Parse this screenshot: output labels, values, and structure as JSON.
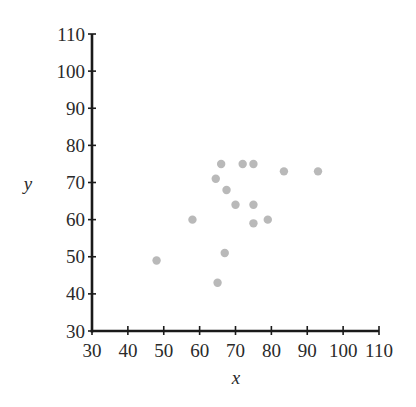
{
  "chart_data": {
    "type": "scatter",
    "title": "",
    "xlabel": "x",
    "ylabel": "y",
    "xlim": [
      30,
      110
    ],
    "ylim": [
      30,
      110
    ],
    "xticks": [
      30,
      40,
      50,
      60,
      70,
      80,
      90,
      100,
      110
    ],
    "yticks": [
      30,
      40,
      50,
      60,
      70,
      80,
      90,
      100,
      110
    ],
    "grid": false,
    "legend": null,
    "point_color": "#b9b9b9",
    "axis_color": "#1a1a1a",
    "points": [
      {
        "x": 48,
        "y": 49
      },
      {
        "x": 58,
        "y": 60
      },
      {
        "x": 64.5,
        "y": 71
      },
      {
        "x": 65,
        "y": 43
      },
      {
        "x": 66,
        "y": 75
      },
      {
        "x": 67,
        "y": 51
      },
      {
        "x": 67.5,
        "y": 68
      },
      {
        "x": 70,
        "y": 64
      },
      {
        "x": 72,
        "y": 75
      },
      {
        "x": 75,
        "y": 75
      },
      {
        "x": 75,
        "y": 64
      },
      {
        "x": 75,
        "y": 59
      },
      {
        "x": 79,
        "y": 60
      },
      {
        "x": 83.5,
        "y": 73
      },
      {
        "x": 93,
        "y": 73
      }
    ]
  }
}
